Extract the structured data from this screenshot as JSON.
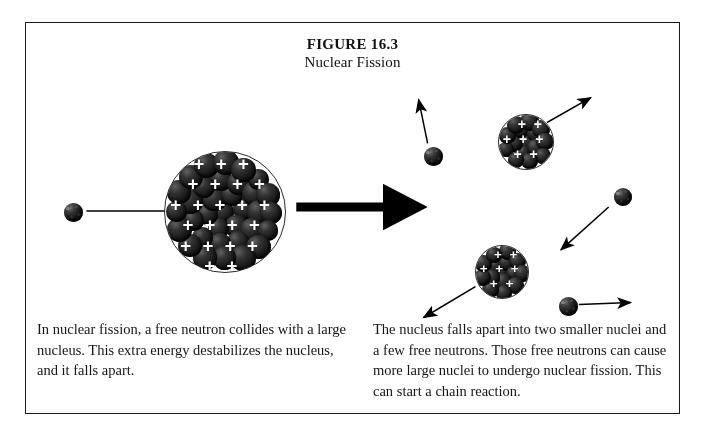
{
  "figure": {
    "number": "FIGURE 16.3",
    "subtitle": "Nuclear Fission"
  },
  "captions": {
    "left": "In nuclear fission, a free neutron collides with a large nucleus.  This extra energy destabilizes the nucleus, and it falls apart.",
    "right": "The nucleus falls apart into two smaller nuclei and a few free neutrons.  Those free neutrons can cause more large nuclei to undergo nuclear fission.  This can start a chain reaction."
  },
  "colors": {
    "frame_border": "#1a1a1a",
    "particle_dark": "#141414",
    "proton_mark": "#ffffff",
    "arrow": "#000000",
    "background": "#ffffff",
    "text": "#151515"
  },
  "diagram": {
    "type": "nuclear-fission-schematic",
    "reactant_neutron": {
      "label": "free neutron",
      "cx": 72,
      "cy": 211,
      "d": 19
    },
    "large_nucleus": {
      "label": "large nucleus",
      "cx": 222,
      "cy": 210,
      "d": 120,
      "proton_marks": 24,
      "nucleons": 46
    },
    "reaction_arrow": {
      "x1": 296,
      "y1": 207,
      "x2": 420,
      "y2": 207,
      "thickness": 9
    },
    "product_nuclei": [
      {
        "label": "smaller nucleus upper",
        "cx": 524,
        "cy": 140,
        "d": 54,
        "proton_marks": 8,
        "nucleons": 17,
        "arrow": {
          "x1": 548,
          "y1": 122,
          "x2": 592,
          "y2": 97
        }
      },
      {
        "label": "smaller nucleus lower",
        "cx": 500,
        "cy": 270,
        "d": 52,
        "proton_marks": 7,
        "nucleons": 16,
        "arrow": {
          "x1": 476,
          "y1": 287,
          "x2": 424,
          "y2": 318
        }
      }
    ],
    "free_neutrons": [
      {
        "label": "free neutron top",
        "cx": 432,
        "cy": 155,
        "d": 19,
        "arrow": {
          "x1": 428,
          "y1": 143,
          "x2": 419,
          "y2": 99
        }
      },
      {
        "label": "free neutron right",
        "cx": 622,
        "cy": 196,
        "d": 18,
        "arrow": {
          "x1": 610,
          "y1": 207,
          "x2": 562,
          "y2": 250
        }
      },
      {
        "label": "free neutron bottom right",
        "cx": 567,
        "cy": 305,
        "d": 19,
        "arrow": {
          "x1": 580,
          "y1": 305,
          "x2": 632,
          "y2": 303
        }
      }
    ]
  }
}
